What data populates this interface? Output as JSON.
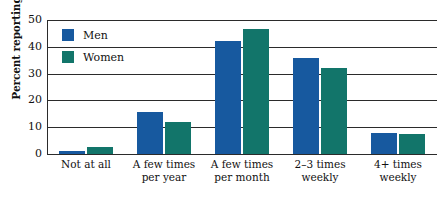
{
  "chart_data": {
    "type": "bar",
    "title": "",
    "xlabel": "",
    "ylabel": "Percent reporting",
    "ylim": [
      0,
      50
    ],
    "yticks": [
      0,
      10,
      20,
      30,
      40,
      50
    ],
    "ytick_labels": [
      "0",
      "10",
      "20",
      "30",
      "40",
      "50"
    ],
    "grid": true,
    "legend_position": "upper-left-inside",
    "categories": [
      {
        "line1": "Not at all",
        "line2": ""
      },
      {
        "line1": "A few times",
        "line2": "per year"
      },
      {
        "line1": "A few times",
        "line2": "per month"
      },
      {
        "line1": "2–3 times",
        "line2": "weekly"
      },
      {
        "line1": "4+ times",
        "line2": "weekly"
      }
    ],
    "series": [
      {
        "name": "Men",
        "color": "#17599f",
        "values": [
          1,
          15.5,
          42,
          36,
          8
        ]
      },
      {
        "name": "Women",
        "color": "#12756a",
        "values": [
          2.5,
          12,
          46.5,
          32,
          7.5
        ]
      }
    ]
  },
  "legend": {
    "entries": [
      {
        "label": "Men",
        "swatch": "#17599f"
      },
      {
        "label": "Women",
        "swatch": "#12756a"
      }
    ]
  },
  "colors": {
    "men": "#17599f",
    "women": "#12756a",
    "axis": "#2b2b2b",
    "background": "#ffffff",
    "text": "#111111"
  }
}
